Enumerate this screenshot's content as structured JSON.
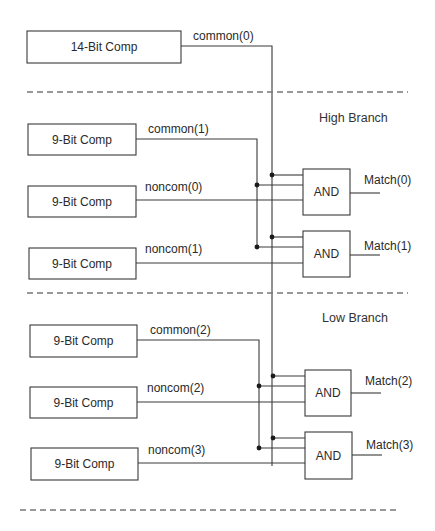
{
  "diagram": {
    "top_comparator": {
      "label": "14-Bit Comp",
      "output_signal": "common(0)"
    },
    "sections": [
      {
        "title": "High Branch",
        "comparators": [
          {
            "label": "9-Bit Comp",
            "output_signal": "common(1)"
          },
          {
            "label": "9-Bit Comp",
            "output_signal": "noncom(0)"
          },
          {
            "label": "9-Bit Comp",
            "output_signal": "noncom(1)"
          }
        ],
        "gates": [
          {
            "label": "AND",
            "inputs": [
              "common(0)",
              "common(1)",
              "noncom(0)"
            ],
            "output": "Match(0)"
          },
          {
            "label": "AND",
            "inputs": [
              "common(0)",
              "common(1)",
              "noncom(1)"
            ],
            "output": "Match(1)"
          }
        ]
      },
      {
        "title": "Low Branch",
        "comparators": [
          {
            "label": "9-Bit Comp",
            "output_signal": "common(2)"
          },
          {
            "label": "9-Bit Comp",
            "output_signal": "noncom(2)"
          },
          {
            "label": "9-Bit Comp",
            "output_signal": "noncom(3)"
          }
        ],
        "gates": [
          {
            "label": "AND",
            "inputs": [
              "common(0)",
              "common(2)",
              "noncom(2)"
            ],
            "output": "Match(2)"
          },
          {
            "label": "AND",
            "inputs": [
              "common(0)",
              "common(2)",
              "noncom(3)"
            ],
            "output": "Match(3)"
          }
        ]
      }
    ]
  }
}
